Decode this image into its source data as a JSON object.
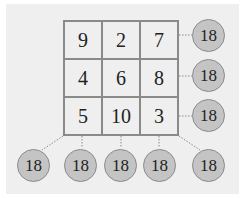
{
  "puzzle": {
    "type": "magic-square",
    "grid": [
      [
        9,
        2,
        7
      ],
      [
        4,
        6,
        8
      ],
      [
        5,
        10,
        3
      ]
    ],
    "cells": [
      "9",
      "2",
      "7",
      "4",
      "6",
      "8",
      "5",
      "10",
      "3"
    ],
    "row_sums": [
      "18",
      "18",
      "18"
    ],
    "bottom_sums": [
      "18",
      "18",
      "18",
      "18",
      "18"
    ],
    "colors": {
      "background": "#efefef",
      "circle_fill": "#c4c4c4",
      "border": "#8a8a8a",
      "text": "#222222"
    }
  }
}
